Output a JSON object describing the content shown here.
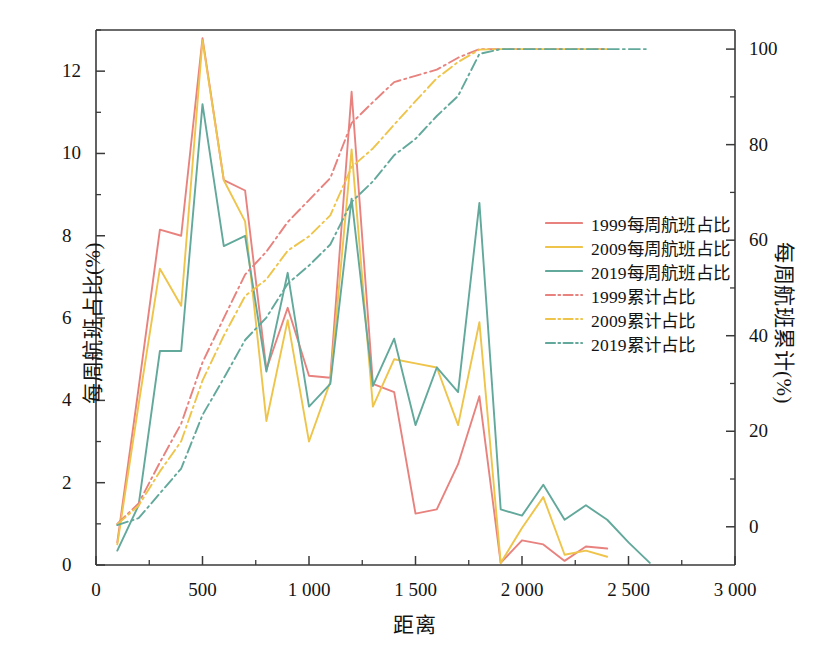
{
  "chart_data": {
    "type": "line",
    "title": "",
    "xlabel": "距离",
    "ylabel": "每周航班占比(%)",
    "ylabel_right": "每周航班累计(%)",
    "xlim": [
      0,
      3000
    ],
    "ylim": [
      0,
      13
    ],
    "ylim_right": [
      -8,
      104
    ],
    "grid": false,
    "legend_position": "center-right",
    "xticks": [
      0,
      500,
      1000,
      1500,
      2000,
      2500,
      3000
    ],
    "xticklabels": [
      "0",
      "500",
      "1 000",
      "1 500",
      "2 000",
      "2 500",
      "3 000"
    ],
    "xminorticks": [
      250,
      750,
      1250,
      1750,
      2250,
      2750
    ],
    "yticks_left": [
      0,
      2,
      4,
      6,
      8,
      10,
      12
    ],
    "yticklabels_left": [
      "0",
      "2",
      "4",
      "6",
      "8",
      "10",
      "12"
    ],
    "yminorticks_left": [
      1,
      3,
      5,
      7,
      9,
      11,
      13
    ],
    "yticks_right": [
      0,
      20,
      40,
      60,
      80,
      100
    ],
    "yticklabels_right": [
      "0",
      "20",
      "40",
      "60",
      "80",
      "100"
    ],
    "yminorticks_right": [
      10,
      30,
      50,
      70,
      90
    ],
    "colors": {
      "1999": "#E8827E",
      "2009": "#EFC44A",
      "2019": "#62A99B",
      "axis": "#3a3a3a",
      "text": "#141414"
    },
    "x": [
      100,
      200,
      300,
      400,
      500,
      600,
      700,
      800,
      900,
      1000,
      1100,
      1200,
      1300,
      1400,
      1500,
      1600,
      1700,
      1800,
      1900,
      2000,
      2100,
      2200,
      2300,
      2400,
      2500,
      2600
    ],
    "series": [
      {
        "name": "1999每周航班占比",
        "label": "1999每周航班占比",
        "axis": "left",
        "style": "solid",
        "color": "#E8827E",
        "values": [
          0.55,
          4.3,
          8.15,
          8.0,
          12.8,
          9.35,
          9.1,
          4.75,
          6.25,
          4.6,
          4.55,
          11.5,
          4.4,
          4.2,
          1.25,
          1.35,
          2.45,
          4.1,
          0.05,
          0.6,
          0.5,
          0.1,
          0.45,
          0.4,
          null,
          null
        ]
      },
      {
        "name": "2009每周航班占比",
        "label": "2009每周航班占比",
        "axis": "left",
        "style": "solid",
        "color": "#EFC44A",
        "values": [
          0.5,
          3.9,
          7.2,
          6.3,
          12.75,
          9.35,
          8.35,
          3.5,
          5.95,
          3.0,
          4.45,
          10.1,
          3.85,
          5.0,
          4.9,
          4.8,
          3.4,
          5.9,
          0.05,
          0.9,
          1.65,
          0.25,
          0.35,
          0.2,
          null,
          null
        ]
      },
      {
        "name": "2019每周航班占比",
        "label": "2019每周航班占比",
        "axis": "left",
        "style": "solid",
        "color": "#62A99B",
        "values": [
          0.35,
          1.45,
          5.2,
          5.2,
          11.2,
          7.75,
          8.0,
          4.7,
          7.1,
          3.85,
          4.4,
          8.9,
          4.35,
          5.5,
          3.4,
          4.8,
          4.2,
          8.8,
          1.35,
          1.2,
          1.95,
          1.1,
          1.45,
          1.1,
          0.55,
          0.05
        ]
      },
      {
        "name": "1999累计占比",
        "label": "1999累计占比",
        "axis": "right",
        "style": "dashdot",
        "color": "#E8827E",
        "values": [
          0.6,
          4.9,
          13.5,
          21.6,
          34.4,
          43.7,
          52.8,
          57.6,
          63.8,
          68.4,
          73.0,
          84.5,
          88.9,
          93.1,
          94.4,
          95.7,
          98.2,
          100.0,
          100.0,
          100.0,
          100.0,
          100.0,
          100.0,
          100.0,
          null,
          null
        ]
      },
      {
        "name": "2009累计占比",
        "label": "2009累计占比",
        "axis": "right",
        "style": "dashdot",
        "color": "#EFC44A",
        "values": [
          0.5,
          4.4,
          11.6,
          17.9,
          30.6,
          40.0,
          48.3,
          51.8,
          57.8,
          60.8,
          65.2,
          75.3,
          79.2,
          84.2,
          89.1,
          93.9,
          97.3,
          99.9,
          100.0,
          100.0,
          100.0,
          100.0,
          100.0,
          100.0,
          null,
          null
        ]
      },
      {
        "name": "2019累计占比",
        "label": "2019累计占比",
        "axis": "right",
        "style": "dashdot",
        "color": "#62A99B",
        "values": [
          0.35,
          1.8,
          7.0,
          12.2,
          23.4,
          31.1,
          39.1,
          43.8,
          50.9,
          54.7,
          59.1,
          68.0,
          72.3,
          77.8,
          81.2,
          86.0,
          90.2,
          99.0,
          100.0,
          100.0,
          100.0,
          100.0,
          100.0,
          100.0,
          100.0,
          100.0
        ]
      }
    ]
  }
}
